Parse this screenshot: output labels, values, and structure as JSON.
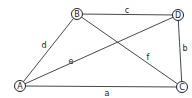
{
  "diagram": {
    "type": "graph",
    "nodes": [
      {
        "id": "A",
        "label": "A",
        "x": 20,
        "y": 86
      },
      {
        "id": "B",
        "label": "B",
        "x": 77,
        "y": 14
      },
      {
        "id": "D",
        "label": "D",
        "x": 178,
        "y": 15
      },
      {
        "id": "C",
        "label": "C",
        "x": 182,
        "y": 87
      }
    ],
    "edges": [
      {
        "from": "A",
        "to": "B",
        "label": "d"
      },
      {
        "from": "B",
        "to": "D",
        "label": "c"
      },
      {
        "from": "D",
        "to": "C",
        "label": "b"
      },
      {
        "from": "A",
        "to": "C",
        "label": "a"
      },
      {
        "from": "A",
        "to": "D",
        "label": "e"
      },
      {
        "from": "B",
        "to": "C",
        "label": "f"
      }
    ]
  }
}
